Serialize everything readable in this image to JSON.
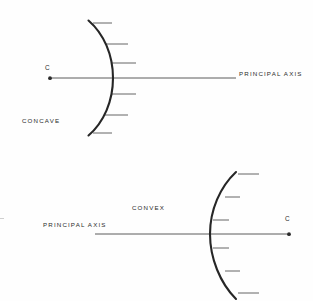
{
  "document": {
    "title": "Concave and Convex Mirror Diagram",
    "background_color": "#ffffff",
    "ink_color": "#2b2b2b",
    "line_color": "#3a3a3a"
  },
  "figures": [
    {
      "id": "concave",
      "name_label": "CONCAVE",
      "axis_label": "PRINCIPAL AXIS",
      "center_label": "C",
      "mirror_type": "concave",
      "center_of_curvature_side": "left",
      "hatching_side": "right",
      "hatch_count": 6,
      "vertex_x": 113,
      "axis_y": 78,
      "arc_top_y": 20,
      "arc_bottom_y": 136,
      "arc_edge_x": 88,
      "axis_start_x": 50,
      "axis_end_x": 236,
      "center_point_x": 50
    },
    {
      "id": "convex",
      "name_label": "CONVEX",
      "axis_label": "PRINCIPAL AXIS",
      "center_label": "C",
      "mirror_type": "convex",
      "center_of_curvature_side": "right",
      "hatching_side": "right",
      "hatch_count": 6,
      "vertex_x": 210,
      "axis_y": 234,
      "arc_top_y": 172,
      "arc_bottom_y": 299,
      "arc_edge_x": 236,
      "axis_start_x": 95,
      "axis_end_x": 289,
      "center_point_x": 289
    }
  ]
}
